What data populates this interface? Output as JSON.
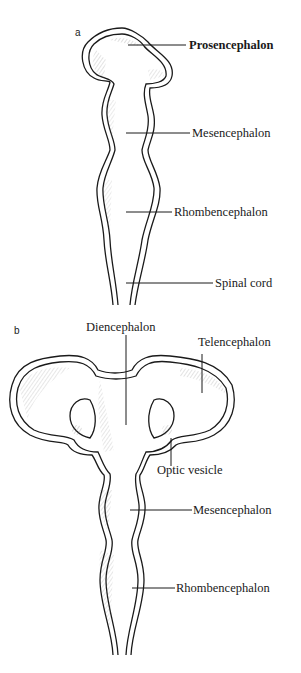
{
  "panels": [
    {
      "id": "a",
      "label": "a",
      "structures": [
        {
          "name": "Prosencephalon"
        },
        {
          "name": "Mesencephalon"
        },
        {
          "name": "Rhombencephalon"
        },
        {
          "name": "Spinal cord"
        }
      ]
    },
    {
      "id": "b",
      "label": "b",
      "structures": [
        {
          "name": "Diencephalon"
        },
        {
          "name": "Telencephalon"
        },
        {
          "name": "Optic vesicle"
        },
        {
          "name": "Mesencephalon"
        },
        {
          "name": "Rhombencephalon"
        }
      ]
    }
  ],
  "colors": {
    "ink": "#1a1a1a",
    "background": "#ffffff",
    "shade": "#9a9a9a"
  }
}
